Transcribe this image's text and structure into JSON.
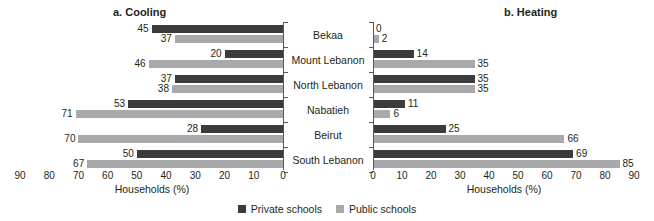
{
  "figure": {
    "panel_titles": {
      "cooling": "a. Cooling",
      "heating": "b. Heating"
    },
    "axis_title": "Households (%)",
    "legend": [
      {
        "label": "Private schools",
        "color": "#3b3b3c",
        "key": "private"
      },
      {
        "label": "Public schools",
        "color": "#a9a9ab",
        "key": "public"
      }
    ],
    "categories": [
      "Bekaa",
      "Mount Lebanon",
      "North Lebanon",
      "Nabatieh",
      "Beirut",
      "South Lebanon"
    ],
    "cooling_ticks": [
      "90",
      "80",
      "70",
      "60",
      "50",
      "40",
      "30",
      "20",
      "10",
      "0"
    ],
    "heating_ticks": [
      "0",
      "10",
      "20",
      "30",
      "40",
      "50",
      "60",
      "70",
      "80",
      "90"
    ]
  },
  "chart_data": [
    {
      "type": "bar",
      "title": "a. Cooling",
      "orientation": "horizontal",
      "direction": "right-to-left",
      "xlabel": "Households (%)",
      "ylabel": "",
      "xlim": [
        0,
        90
      ],
      "xticks": [
        0,
        10,
        20,
        30,
        40,
        50,
        60,
        70,
        80,
        90
      ],
      "grid": false,
      "legend_position": "bottom-center",
      "categories": [
        "Bekaa",
        "Mount Lebanon",
        "North Lebanon",
        "Nabatieh",
        "Beirut",
        "South Lebanon"
      ],
      "series": [
        {
          "name": "Private schools",
          "color": "#3b3b3c",
          "values": [
            45,
            20,
            37,
            53,
            28,
            50
          ]
        },
        {
          "name": "Public schools",
          "color": "#a9a9ab",
          "values": [
            37,
            46,
            38,
            71,
            70,
            67
          ]
        }
      ]
    },
    {
      "type": "bar",
      "title": "b. Heating",
      "orientation": "horizontal",
      "direction": "left-to-right",
      "xlabel": "Households (%)",
      "ylabel": "",
      "xlim": [
        0,
        90
      ],
      "xticks": [
        0,
        10,
        20,
        30,
        40,
        50,
        60,
        70,
        80,
        90
      ],
      "grid": false,
      "legend_position": "bottom-center",
      "categories": [
        "Bekaa",
        "Mount Lebanon",
        "North Lebanon",
        "Nabatieh",
        "Beirut",
        "South Lebanon"
      ],
      "series": [
        {
          "name": "Private schools",
          "color": "#3b3b3c",
          "values": [
            0,
            14,
            35,
            11,
            25,
            69
          ]
        },
        {
          "name": "Public schools",
          "color": "#a9a9ab",
          "values": [
            2,
            35,
            35,
            6,
            66,
            85
          ]
        }
      ]
    }
  ]
}
